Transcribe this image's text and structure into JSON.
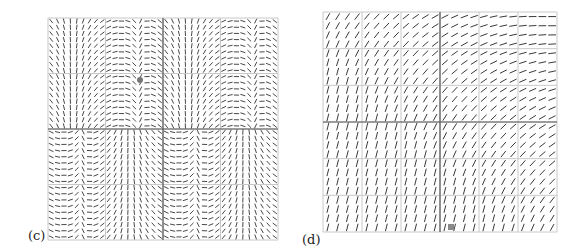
{
  "figure": {
    "panels": [
      {
        "id": "c",
        "label": "(c)",
        "label_pos": [
          28,
          232
        ],
        "box": [
          48,
          18,
          278,
          240
        ],
        "grid_major": 4,
        "grid_color": "#c8c8c8",
        "axis_color": "#555555",
        "arrow_color": "#333333",
        "arrow_cols": 36,
        "arrow_rows": 36,
        "field": "saddle-periodic",
        "marker": {
          "x": 140,
          "y": 80,
          "shape": "circle",
          "color": "#777777"
        }
      },
      {
        "id": "d",
        "label": "(d)",
        "label_pos": [
          302,
          238
        ],
        "box": [
          323,
          12,
          557,
          232
        ],
        "grid_major": 6,
        "grid_color": "#c8c8c8",
        "axis_color": "#555555",
        "arrow_color": "#222222",
        "arrow_cols": 24,
        "arrow_rows": 24,
        "field": "rotating-diagonal",
        "marker": {
          "x": 451,
          "y": 227,
          "shape": "square",
          "color": "#888888"
        }
      }
    ]
  }
}
